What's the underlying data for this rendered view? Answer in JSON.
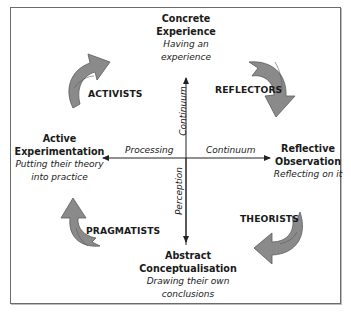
{
  "diagram": {
    "colors": {
      "frame": "#6b6b6b",
      "arrow_fill": "#8a8a8a",
      "arrow_stroke": "#5a5a5a",
      "axis": "#222222",
      "text": "#1a1a1a"
    },
    "stages": {
      "top": {
        "title_line1": "Concrete",
        "title_line2": "Experience",
        "sub_line1": "Having an",
        "sub_line2": "experience"
      },
      "right": {
        "title_line1": "Reflective",
        "title_line2": "Observation",
        "sub_line1": "Reflecting on it"
      },
      "bottom": {
        "title_line1": "Abstract",
        "title_line2": "Conceptualisation",
        "sub_line1": "Drawing their own",
        "sub_line2": "conclusions"
      },
      "left": {
        "title_line1": "Active",
        "title_line2": "Experimentation",
        "sub_line1": "Putting their theory",
        "sub_line2": "into practice"
      }
    },
    "learner_styles": {
      "top_left": "ACTIVISTS",
      "top_right": "REFLECTORS",
      "bottom_right": "THEORISTS",
      "bottom_left": "PRAGMATISTS"
    },
    "axes": {
      "horizontal_left": "Processing",
      "horizontal_right": "Continuum",
      "vertical_top": "Continuum",
      "vertical_bottom": "Perception"
    }
  }
}
